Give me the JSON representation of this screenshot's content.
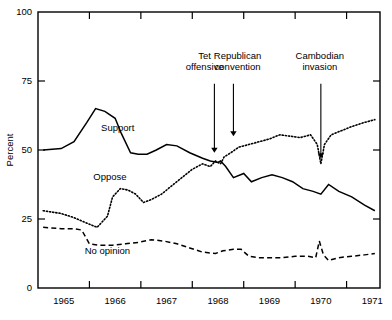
{
  "chart_data": {
    "type": "line",
    "title": "",
    "xlabel": "",
    "ylabel": "Percent",
    "xlim": [
      1964.5,
      1971.15
    ],
    "ylim": [
      0,
      100
    ],
    "grid": false,
    "legend": "inline-labels",
    "x_tick_labels": [
      "1965",
      "1966",
      "1967",
      "1968",
      "1969",
      "1970",
      "1971"
    ],
    "x_tick_values": [
      1965,
      1966,
      1967,
      1968,
      1969,
      1970,
      1971
    ],
    "y_tick_labels": [
      "0",
      "25",
      "50",
      "75",
      "100"
    ],
    "y_tick_values": [
      0,
      25,
      50,
      75,
      100
    ],
    "series": [
      {
        "name": "Support",
        "style": "solid",
        "label_x": 1966.05,
        "label_y": 57,
        "x": [
          1964.6,
          1964.95,
          1965.2,
          1965.45,
          1965.62,
          1965.8,
          1966.0,
          1966.12,
          1966.3,
          1966.45,
          1966.62,
          1966.8,
          1967.0,
          1967.2,
          1967.45,
          1967.7,
          1967.85,
          1968.0,
          1968.05,
          1968.15,
          1968.3,
          1968.5,
          1968.65,
          1968.85,
          1969.05,
          1969.25,
          1969.45,
          1969.65,
          1969.85,
          1970.0,
          1970.15,
          1970.35,
          1970.6,
          1970.85,
          1971.05
        ],
        "values": [
          50,
          50.5,
          53,
          60,
          65,
          64,
          61.5,
          56,
          49,
          48.5,
          48.5,
          50,
          52,
          51.5,
          49,
          47,
          46,
          45.5,
          46,
          44,
          40,
          41.5,
          38.5,
          40,
          41,
          40,
          38.5,
          36,
          35,
          34,
          37.5,
          35,
          33,
          30,
          28
        ]
      },
      {
        "name": "Oppose",
        "style": "dotted",
        "label_x": 1965.9,
        "label_y": 39,
        "x": [
          1964.6,
          1964.95,
          1965.2,
          1965.45,
          1965.65,
          1965.85,
          1965.95,
          1966.1,
          1966.25,
          1966.4,
          1966.55,
          1966.7,
          1966.9,
          1967.1,
          1967.3,
          1967.5,
          1967.7,
          1967.85,
          1967.95,
          1968.05,
          1968.12,
          1968.25,
          1968.4,
          1968.6,
          1968.8,
          1969.0,
          1969.2,
          1969.4,
          1969.6,
          1969.8,
          1969.93,
          1970.0,
          1970.07,
          1970.2,
          1970.4,
          1970.6,
          1970.85,
          1971.05
        ],
        "values": [
          28,
          27,
          25.5,
          23.5,
          22,
          26,
          33,
          36,
          35.5,
          34,
          31,
          32,
          34,
          37,
          40,
          43,
          45,
          44,
          46,
          45,
          47.5,
          49,
          51,
          52,
          53,
          54,
          55.5,
          55,
          54.5,
          55.5,
          52,
          45,
          52,
          55.5,
          57,
          58.5,
          60,
          61
        ]
      },
      {
        "name": "No opinion",
        "style": "dashed",
        "label_x": 1965.85,
        "label_y": 12.5,
        "x": [
          1964.6,
          1964.95,
          1965.2,
          1965.35,
          1965.5,
          1965.7,
          1965.95,
          1966.2,
          1966.45,
          1966.7,
          1966.95,
          1967.2,
          1967.45,
          1967.7,
          1967.95,
          1968.1,
          1968.3,
          1968.45,
          1968.6,
          1968.8,
          1969.0,
          1969.25,
          1969.5,
          1969.75,
          1969.9,
          1969.97,
          1970.05,
          1970.15,
          1970.35,
          1970.6,
          1970.85,
          1971.05
        ],
        "values": [
          22,
          21.5,
          21.5,
          21,
          16,
          15.5,
          15.5,
          16,
          16.5,
          17.5,
          17,
          16,
          14.5,
          13,
          12.5,
          13.5,
          14,
          14,
          11.5,
          11,
          11,
          11,
          11.5,
          11.5,
          11,
          17,
          12,
          10,
          11,
          11.5,
          12,
          12.5
        ]
      }
    ],
    "annotations": [
      {
        "name": "tet-offensive",
        "text_lines": [
          "Tet",
          "offensive"
        ],
        "label_x": 1967.74,
        "label_y": 83,
        "arrow_x": 1967.93,
        "arrow_from_y": 74,
        "arrow_to_y": 49
      },
      {
        "name": "republican-convention",
        "text_lines": [
          "Republican",
          "convention"
        ],
        "label_x": 1968.38,
        "label_y": 83,
        "arrow_x": 1968.3,
        "arrow_from_y": 74,
        "arrow_to_y": 55
      },
      {
        "name": "cambodian-invasion",
        "text_lines": [
          "Cambodian",
          "invasion"
        ],
        "label_x": 1969.98,
        "label_y": 83,
        "arrow_x": 1970.0,
        "arrow_from_y": 74,
        "arrow_to_y": 47
      }
    ]
  }
}
